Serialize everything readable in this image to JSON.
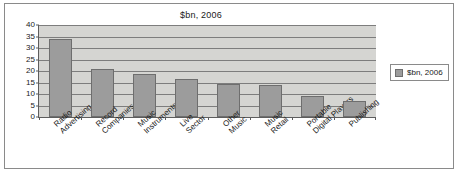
{
  "chart_data": {
    "type": "bar",
    "title": "$bn, 2006",
    "xlabel": "",
    "ylabel": "",
    "ylim": [
      0,
      40
    ],
    "yticks": [
      0,
      5,
      10,
      15,
      20,
      25,
      30,
      35,
      40
    ],
    "grid": true,
    "legend_position": "right",
    "legend": [
      "$bn, 2006"
    ],
    "categories": [
      "Radio Advertising",
      "Record Companies",
      "Music Instruments",
      "Live Sector",
      "Other Music",
      "Music Retail",
      "Portable Digital Players",
      "Publishing"
    ],
    "category_lines": [
      [
        "Radio",
        "Advertising"
      ],
      [
        "Record",
        "Companies"
      ],
      [
        "Music",
        "Instruments"
      ],
      [
        "Live",
        "Sector"
      ],
      [
        "Other",
        "Music"
      ],
      [
        "Music",
        "Retail"
      ],
      [
        "Portable",
        "Digital Players"
      ],
      [
        "Publishing",
        ""
      ]
    ],
    "series": [
      {
        "name": "$bn, 2006",
        "values": [
          34,
          21,
          18.5,
          16.5,
          14.5,
          14,
          9,
          7
        ]
      }
    ],
    "colors": {
      "bar_fill": "#9c9c9c",
      "bar_border": "#6e6e6e",
      "plot_background": "#d5d5d2",
      "gridline": "#7d7d7d",
      "axis": "#5d5d5d",
      "frame_border": "#8a8a8a",
      "page_background": "#ffffff",
      "text": "#1a1a1a"
    }
  }
}
